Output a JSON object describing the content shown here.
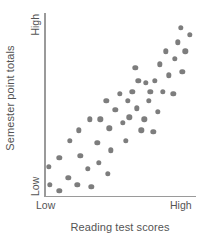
{
  "chart_data": {
    "type": "scatter",
    "title": "",
    "xlabel": "Reading test scores",
    "ylabel": "Semester point totals",
    "xticklabels": [
      "Low",
      "High"
    ],
    "yticklabels": [
      "Low",
      "High"
    ],
    "xlim": [
      0,
      100
    ],
    "ylim": [
      0,
      100
    ],
    "grid": false,
    "legend": null,
    "marker_color": "#7d7d7d",
    "axis_color": "#9a9a9a",
    "text_color": "#545454",
    "points": [
      {
        "x": 4,
        "y": 6
      },
      {
        "x": 10,
        "y": 3
      },
      {
        "x": 3,
        "y": 16
      },
      {
        "x": 16,
        "y": 10
      },
      {
        "x": 10,
        "y": 21
      },
      {
        "x": 22,
        "y": 6
      },
      {
        "x": 17,
        "y": 30
      },
      {
        "x": 24,
        "y": 22
      },
      {
        "x": 31,
        "y": 5
      },
      {
        "x": 29,
        "y": 15
      },
      {
        "x": 23,
        "y": 36
      },
      {
        "x": 36,
        "y": 18
      },
      {
        "x": 30,
        "y": 42
      },
      {
        "x": 37,
        "y": 42
      },
      {
        "x": 35,
        "y": 29
      },
      {
        "x": 42,
        "y": 12
      },
      {
        "x": 44,
        "y": 25
      },
      {
        "x": 43,
        "y": 37
      },
      {
        "x": 41,
        "y": 52
      },
      {
        "x": 47,
        "y": 47
      },
      {
        "x": 52,
        "y": 40
      },
      {
        "x": 50,
        "y": 56
      },
      {
        "x": 54,
        "y": 30
      },
      {
        "x": 55,
        "y": 52
      },
      {
        "x": 58,
        "y": 57
      },
      {
        "x": 61,
        "y": 48
      },
      {
        "x": 62,
        "y": 63
      },
      {
        "x": 60,
        "y": 70
      },
      {
        "x": 66,
        "y": 42
      },
      {
        "x": 69,
        "y": 52
      },
      {
        "x": 70,
        "y": 57
      },
      {
        "x": 64,
        "y": 36
      },
      {
        "x": 72,
        "y": 35
      },
      {
        "x": 75,
        "y": 46
      },
      {
        "x": 73,
        "y": 63
      },
      {
        "x": 78,
        "y": 57
      },
      {
        "x": 76,
        "y": 72
      },
      {
        "x": 82,
        "y": 66
      },
      {
        "x": 80,
        "y": 79
      },
      {
        "x": 85,
        "y": 56
      },
      {
        "x": 86,
        "y": 75
      },
      {
        "x": 88,
        "y": 84
      },
      {
        "x": 91,
        "y": 68
      },
      {
        "x": 93,
        "y": 79
      },
      {
        "x": 90,
        "y": 92
      },
      {
        "x": 96,
        "y": 88
      },
      {
        "x": 56,
        "y": 43
      },
      {
        "x": 67,
        "y": 62
      }
    ]
  }
}
